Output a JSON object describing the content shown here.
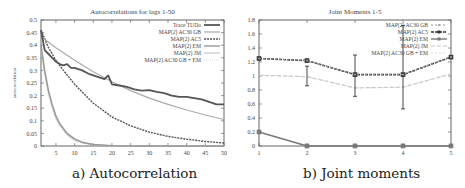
{
  "figure": {
    "captions": [
      "a) Autocorrelation",
      "b) Joint moments"
    ]
  },
  "chart_data": [
    {
      "type": "line",
      "title": "Autocorrelations for lags 1-50",
      "xlabel": "lag",
      "ylabel": "autocorrelation",
      "xlim": [
        1,
        50
      ],
      "ylim": [
        0,
        0.5
      ],
      "xticks": [
        5,
        10,
        15,
        20,
        25,
        30,
        35,
        40,
        45,
        50
      ],
      "yticks": [
        0,
        0.05,
        0.1,
        0.15,
        0.2,
        0.25,
        0.3,
        0.35,
        0.4,
        0.45,
        0.5
      ],
      "ytick_labels": [
        "0",
        "0.05",
        "0.1",
        "0.15",
        "0.2",
        "0.25",
        "0.3",
        "0.35",
        "0.4",
        "0.45",
        "0.5"
      ],
      "grid": false,
      "legend_position": "upper right",
      "series": [
        {
          "name": "Trace TUDo",
          "color": "#555555",
          "width": 1.8,
          "dash": "",
          "x": [
            1,
            2,
            3,
            4,
            5,
            6,
            7,
            8,
            9,
            10,
            12,
            14,
            16,
            18,
            19,
            20,
            22,
            24,
            26,
            28,
            30,
            32,
            34,
            36,
            38,
            40,
            42,
            44,
            46,
            48,
            50
          ],
          "values": [
            0.46,
            0.38,
            0.365,
            0.35,
            0.335,
            0.325,
            0.32,
            0.325,
            0.31,
            0.31,
            0.3,
            0.285,
            0.275,
            0.265,
            0.28,
            0.245,
            0.24,
            0.235,
            0.225,
            0.22,
            0.222,
            0.215,
            0.21,
            0.2,
            0.195,
            0.195,
            0.19,
            0.185,
            0.175,
            0.165,
            0.165
          ]
        },
        {
          "name": "MAP(2) AC30 GB",
          "color": "#aaaaaa",
          "width": 1.2,
          "dash": "",
          "x": [
            1,
            5,
            10,
            15,
            20,
            25,
            30,
            35,
            40,
            45,
            50
          ],
          "values": [
            0.435,
            0.39,
            0.34,
            0.295,
            0.255,
            0.22,
            0.19,
            0.165,
            0.143,
            0.123,
            0.105
          ]
        },
        {
          "name": "MAP(2) AC5",
          "color": "#555555",
          "width": 1.4,
          "dash": "2,1",
          "x": [
            1,
            3,
            5,
            7,
            10,
            15,
            20,
            25,
            30,
            35,
            40,
            45,
            50
          ],
          "values": [
            0.46,
            0.39,
            0.34,
            0.3,
            0.245,
            0.17,
            0.115,
            0.08,
            0.055,
            0.038,
            0.027,
            0.018,
            0.012
          ]
        },
        {
          "name": "MAP(2) EM",
          "color": "#999999",
          "width": 1.4,
          "dash": "",
          "x": [
            1,
            2,
            3,
            4,
            5,
            6,
            8,
            10,
            12,
            15,
            20,
            25,
            50
          ],
          "values": [
            0.4,
            0.3,
            0.22,
            0.165,
            0.12,
            0.09,
            0.05,
            0.028,
            0.015,
            0.006,
            0.001,
            0.0,
            0.0
          ]
        },
        {
          "name": "MAP(2) JM",
          "color": "#bbbbbb",
          "width": 1.0,
          "dash": "",
          "x": [
            1,
            2,
            3,
            4,
            5,
            6,
            8,
            10,
            12,
            15,
            20,
            25,
            50
          ],
          "values": [
            0.39,
            0.29,
            0.21,
            0.155,
            0.112,
            0.083,
            0.045,
            0.024,
            0.013,
            0.005,
            0.001,
            0.0,
            0.0
          ]
        },
        {
          "name": "MAP(2) AC30 GB + EM",
          "color": "#dddddd",
          "width": 1.0,
          "dash": "1,1",
          "x": [
            1,
            2,
            3,
            4,
            5,
            6,
            8,
            10,
            12,
            15,
            20,
            25,
            50
          ],
          "values": [
            0.38,
            0.28,
            0.2,
            0.145,
            0.105,
            0.076,
            0.04,
            0.02,
            0.011,
            0.004,
            0.0,
            0.0,
            0.0
          ]
        }
      ]
    },
    {
      "type": "line",
      "title": "Joint Moments 1-5",
      "xlabel": "joint moment",
      "ylabel": "",
      "xlim": [
        1,
        5
      ],
      "ylim": [
        0,
        1.8
      ],
      "xticks": [
        1,
        2,
        3,
        4,
        5
      ],
      "yticks": [
        0,
        0.2,
        0.4,
        0.6,
        0.8,
        1,
        1.2,
        1.4,
        1.6,
        1.8
      ],
      "ytick_labels": [
        "0",
        "0.2",
        "0.4",
        "0.6",
        "0.8",
        "1",
        "1.2",
        "1.4",
        "1.6",
        "1.8"
      ],
      "grid": false,
      "legend_position": "upper right",
      "categories": [
        1,
        2,
        3,
        4,
        5
      ],
      "series": [
        {
          "name": "MAP(2) AC30 GB",
          "color": "#999999",
          "width": 1.0,
          "dash": "2,2",
          "marker": "dot",
          "values": [
            1.25,
            1.22,
            1.02,
            1.02,
            1.27
          ]
        },
        {
          "name": "MAP(2) AC5",
          "color": "#333333",
          "width": 1.6,
          "dash": "3,1",
          "marker": "square",
          "values": [
            1.25,
            1.22,
            1.02,
            1.02,
            1.27
          ],
          "error_bars": [
            [
              1.25,
              1.25
            ],
            [
              0.86,
              1.14
            ],
            [
              0.71,
              1.3
            ],
            [
              0.53,
              1.72
            ],
            [
              1.27,
              1.27
            ]
          ]
        },
        {
          "name": "MAP(2) EM",
          "color": "#777777",
          "width": 1.4,
          "dash": "",
          "marker": "square",
          "values": [
            0.2,
            0.0,
            0.0,
            0.0,
            0.0
          ]
        },
        {
          "name": "MAP(2) JM",
          "color": "#c8c8c8",
          "width": 1.2,
          "dash": "4,2",
          "marker": "none",
          "values": [
            1.01,
            0.99,
            0.83,
            0.84,
            1.03
          ]
        },
        {
          "name": "MAP(2) AC30 GB + EM",
          "color": "#dddddd",
          "width": 1.0,
          "dash": "2,2",
          "marker": "none",
          "values": [
            1.01,
            0.99,
            0.83,
            0.84,
            1.03
          ]
        }
      ]
    }
  ]
}
